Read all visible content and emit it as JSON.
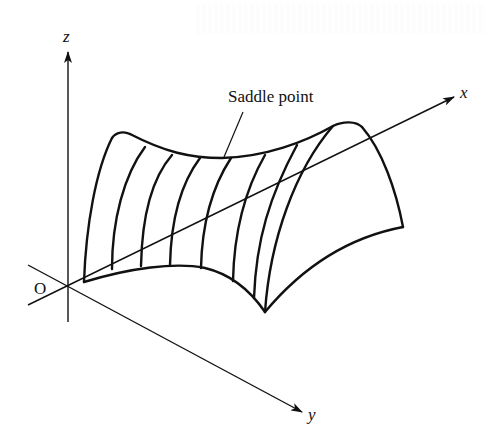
{
  "figure": {
    "type": "3d-surface-diagram",
    "colors": {
      "ink": "#111111",
      "background": "#ffffff"
    }
  },
  "axes": {
    "x_label": "x",
    "y_label": "y",
    "z_label": "z",
    "origin_label": "O"
  },
  "annotations": {
    "saddle_point": "Saddle point"
  }
}
